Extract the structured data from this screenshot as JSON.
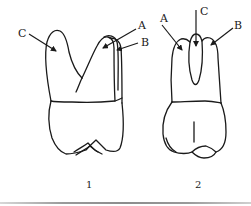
{
  "figure": {
    "tooth_1": {
      "number": "1",
      "labels": {
        "a": "A",
        "b": "B",
        "c": "C"
      }
    },
    "tooth_2": {
      "number": "2",
      "labels": {
        "a": "A",
        "b": "B",
        "c": "C"
      }
    }
  },
  "colors": {
    "line": "#1a1a1a",
    "background": "#ffffff",
    "rule": "#9a9a9a"
  }
}
